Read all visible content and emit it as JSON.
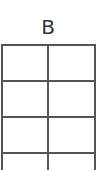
{
  "grid": {
    "column_header": "B",
    "columns": 2,
    "rows": [
      [
        "",
        ""
      ],
      [
        "",
        ""
      ],
      [
        "",
        ""
      ],
      [
        "",
        ""
      ]
    ],
    "line_color": "#555555"
  }
}
